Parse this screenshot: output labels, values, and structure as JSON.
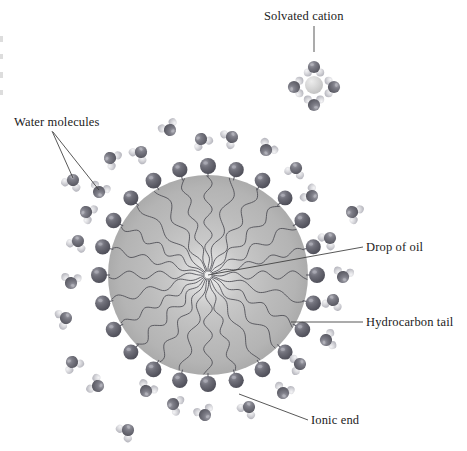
{
  "figure": {
    "background": "#ffffff",
    "width": 467,
    "height": 451
  },
  "colors": {
    "oil_drop_center": "#efefef",
    "oil_drop_mid": "#bdbdbd",
    "oil_drop_edge": "#a9a9a9",
    "ionic_head_dark": "#5a5a64",
    "ionic_head_light": "#8e8e98",
    "oxygen_dark": "#6b6b74",
    "hydrogen_light": "#d8d8de",
    "cation_core": "#d2d2d2",
    "tail_stroke": "#4a4a52",
    "leader_line": "#3a3a3a",
    "text": "#1b1b1b"
  },
  "labels": [
    {
      "id": "solvated-cation",
      "text": "Solvated  cation",
      "x": 264,
      "y": 20,
      "anchor": "start",
      "leaders": [
        [
          314,
          26,
          314,
          52
        ]
      ]
    },
    {
      "id": "water-molecules",
      "text": "Water molecules",
      "x": 14,
      "y": 126,
      "anchor": "start",
      "leaders": [
        [
          52,
          131,
          73,
          178
        ],
        [
          53,
          132,
          99,
          190
        ]
      ]
    },
    {
      "id": "drop-of-oil",
      "text": "Drop of oil",
      "x": 366,
      "y": 251,
      "anchor": "start",
      "leaders": [
        [
          363,
          247,
          208,
          275
        ]
      ]
    },
    {
      "id": "hydrocarbon-tail",
      "text": "Hydrocarbon tail",
      "x": 366,
      "y": 326,
      "anchor": "start",
      "leaders": [
        [
          363,
          322,
          291,
          322
        ]
      ]
    },
    {
      "id": "ionic-end",
      "text": "Ionic end",
      "x": 311,
      "y": 424,
      "anchor": "start",
      "leaders": [
        [
          308,
          420,
          239,
          394
        ]
      ]
    }
  ],
  "oil_drop": {
    "cx": 208,
    "cy": 275,
    "r": 100,
    "name": "drop-of-oil"
  },
  "solvated_cation": {
    "cx": 314,
    "cy": 85,
    "core_r": 9,
    "waters": [
      {
        "x": 314,
        "y": 67,
        "rot": 0
      },
      {
        "x": 294,
        "y": 87,
        "rot": 270
      },
      {
        "x": 334,
        "y": 87,
        "rot": 90
      },
      {
        "x": 314,
        "y": 105,
        "rot": 180
      }
    ]
  },
  "surfactants": [
    {
      "angle": 270,
      "head_r": 8.0
    },
    {
      "angle": 285,
      "head_r": 7.6
    },
    {
      "angle": 300,
      "head_r": 7.8
    },
    {
      "angle": 315,
      "head_r": 7.4
    },
    {
      "angle": 330,
      "head_r": 7.9
    },
    {
      "angle": 345,
      "head_r": 7.5
    },
    {
      "angle": 0,
      "head_r": 8.0
    },
    {
      "angle": 15,
      "head_r": 7.6
    },
    {
      "angle": 30,
      "head_r": 7.8
    },
    {
      "angle": 45,
      "head_r": 7.5
    },
    {
      "angle": 60,
      "head_r": 7.9
    },
    {
      "angle": 75,
      "head_r": 7.6
    },
    {
      "angle": 90,
      "head_r": 8.1
    },
    {
      "angle": 105,
      "head_r": 7.7
    },
    {
      "angle": 120,
      "head_r": 7.9
    },
    {
      "angle": 135,
      "head_r": 7.5
    },
    {
      "angle": 150,
      "head_r": 7.8
    },
    {
      "angle": 165,
      "head_r": 7.6
    },
    {
      "angle": 180,
      "head_r": 8.0
    },
    {
      "angle": 195,
      "head_r": 7.6
    },
    {
      "angle": 210,
      "head_r": 7.8
    },
    {
      "angle": 225,
      "head_r": 7.5
    },
    {
      "angle": 240,
      "head_r": 7.9
    },
    {
      "angle": 255,
      "head_r": 7.6
    }
  ],
  "water_molecules": [
    {
      "x": 73,
      "y": 180,
      "rot": 25
    },
    {
      "x": 99,
      "y": 192,
      "rot": 200
    },
    {
      "x": 110,
      "y": 158,
      "rot": 300
    },
    {
      "x": 141,
      "y": 152,
      "rot": 40
    },
    {
      "x": 170,
      "y": 130,
      "rot": 150
    },
    {
      "x": 201,
      "y": 139,
      "rot": 330
    },
    {
      "x": 232,
      "y": 137,
      "rot": 60
    },
    {
      "x": 266,
      "y": 150,
      "rot": 220
    },
    {
      "x": 296,
      "y": 168,
      "rot": 20
    },
    {
      "x": 312,
      "y": 196,
      "rot": 130
    },
    {
      "x": 352,
      "y": 212,
      "rot": 300
    },
    {
      "x": 330,
      "y": 238,
      "rot": 45
    },
    {
      "x": 343,
      "y": 277,
      "rot": 190
    },
    {
      "x": 333,
      "y": 300,
      "rot": 15
    },
    {
      "x": 326,
      "y": 340,
      "rot": 260
    },
    {
      "x": 300,
      "y": 364,
      "rot": 80
    },
    {
      "x": 283,
      "y": 393,
      "rot": 200
    },
    {
      "x": 249,
      "y": 407,
      "rot": 35
    },
    {
      "x": 205,
      "y": 415,
      "rot": 160
    },
    {
      "x": 173,
      "y": 404,
      "rot": 290
    },
    {
      "x": 128,
      "y": 430,
      "rot": 50
    },
    {
      "x": 146,
      "y": 391,
      "rot": 210
    },
    {
      "x": 98,
      "y": 386,
      "rot": 120
    },
    {
      "x": 72,
      "y": 362,
      "rot": 330
    },
    {
      "x": 66,
      "y": 318,
      "rot": 70
    },
    {
      "x": 71,
      "y": 283,
      "rot": 185
    },
    {
      "x": 78,
      "y": 241,
      "rot": 25
    },
    {
      "x": 86,
      "y": 212,
      "rot": 300
    }
  ],
  "edge_artifacts": [
    {
      "x": 0,
      "y": 36,
      "w": 3,
      "h": 6
    },
    {
      "x": 0,
      "y": 54,
      "w": 3,
      "h": 5
    },
    {
      "x": 0,
      "y": 72,
      "w": 3,
      "h": 6
    },
    {
      "x": 0,
      "y": 90,
      "w": 3,
      "h": 5
    }
  ]
}
